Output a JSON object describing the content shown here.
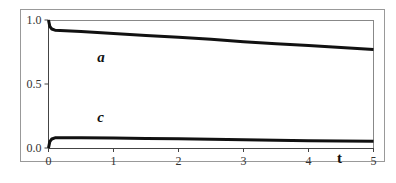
{
  "chart_data": {
    "type": "line",
    "title": "",
    "xlabel": "t",
    "ylabel": "",
    "xlim": [
      0,
      5
    ],
    "ylim": [
      0,
      1
    ],
    "x_ticks": [
      "0",
      "1",
      "2",
      "3",
      "4",
      "5"
    ],
    "y_ticks": [
      "0.0",
      "0.5",
      "1.0"
    ],
    "grid": false,
    "legend": "none (inline curve labels)",
    "series": [
      {
        "name": "a",
        "label_position": {
          "t": 0.75,
          "value": 0.67
        },
        "x": [
          0,
          0.02,
          0.05,
          0.1,
          0.5,
          1,
          1.5,
          2,
          2.5,
          3,
          3.5,
          4,
          4.5,
          5
        ],
        "values": [
          1.0,
          0.95,
          0.93,
          0.92,
          0.91,
          0.895,
          0.88,
          0.865,
          0.85,
          0.83,
          0.815,
          0.8,
          0.785,
          0.77
        ]
      },
      {
        "name": "c",
        "label_position": {
          "t": 0.75,
          "value": 0.2
        },
        "x": [
          0,
          0.02,
          0.05,
          0.1,
          0.5,
          1,
          1.5,
          2,
          2.5,
          3,
          3.5,
          4,
          4.5,
          5
        ],
        "values": [
          0.0,
          0.05,
          0.07,
          0.08,
          0.08,
          0.078,
          0.075,
          0.072,
          0.068,
          0.064,
          0.06,
          0.057,
          0.054,
          0.052
        ]
      }
    ]
  },
  "labels": {
    "x_axis_title": "t",
    "series_a": "a",
    "series_c": "c"
  },
  "colors": {
    "line": "#111111",
    "frame": "#888888",
    "axis": "#555555"
  }
}
